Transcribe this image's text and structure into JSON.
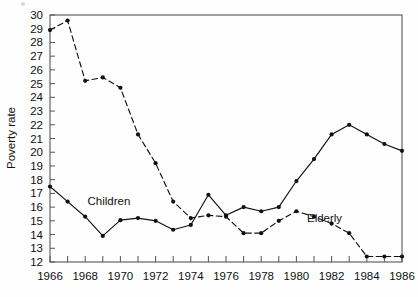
{
  "chart_data": {
    "type": "line",
    "title": "",
    "subtitle": "",
    "xlabel": "",
    "ylabel": "Poverty rate",
    "xlim": [
      1966,
      1986
    ],
    "ylim": [
      12,
      30
    ],
    "ytick_step": 1,
    "xtick_step": 1,
    "xtick_label_step": 2,
    "grid": false,
    "legend_position": "inline-annotation",
    "x": [
      1966,
      1967,
      1968,
      1969,
      1970,
      1971,
      1972,
      1973,
      1974,
      1975,
      1976,
      1977,
      1978,
      1979,
      1980,
      1981,
      1982,
      1983,
      1984,
      1985,
      1986
    ],
    "yticks": [
      12,
      13,
      14,
      15,
      16,
      17,
      18,
      19,
      20,
      21,
      22,
      23,
      24,
      25,
      26,
      27,
      28,
      29,
      30
    ],
    "ytick_labels": [
      "12",
      "13",
      "14",
      "15",
      "16",
      "17",
      "18",
      "19",
      "20",
      "21",
      "22",
      "23",
      "24",
      "25",
      "26",
      "27",
      "28",
      "29",
      "30"
    ],
    "xticks": [
      1966,
      1967,
      1968,
      1969,
      1970,
      1971,
      1972,
      1973,
      1974,
      1975,
      1976,
      1977,
      1978,
      1979,
      1980,
      1981,
      1982,
      1983,
      1984,
      1985,
      1986
    ],
    "xtick_labels": [
      "1966",
      "",
      "1968",
      "",
      "1970",
      "",
      "1972",
      "",
      "1974",
      "",
      "1976",
      "",
      "1978",
      "",
      "1980",
      "",
      "1982",
      "",
      "1984",
      "",
      "1986"
    ],
    "xtick_labels_shown": [
      "1966",
      "1968",
      "1970",
      "1972",
      "1974",
      "1976",
      "1978",
      "1980",
      "1982",
      "1984",
      "1986"
    ],
    "series": [
      {
        "name": "Children",
        "label": "Children",
        "style": "solid",
        "color": "#111111",
        "marker": "filled-circle",
        "values": [
          17.5,
          16.4,
          15.3,
          13.9,
          15.05,
          15.2,
          15.0,
          14.35,
          14.7,
          16.9,
          15.4,
          16.0,
          15.7,
          16.0,
          17.9,
          19.5,
          21.3,
          22.0,
          21.3,
          20.6,
          20.1
        ]
      },
      {
        "name": "Elderly",
        "label": "Elderly",
        "style": "dashed",
        "color": "#111111",
        "marker": "filled-circle",
        "values": [
          28.9,
          29.6,
          25.2,
          25.45,
          24.7,
          21.3,
          19.2,
          16.4,
          15.2,
          15.4,
          15.3,
          14.1,
          14.1,
          15.0,
          15.7,
          15.3,
          14.8,
          14.1,
          12.4,
          12.4,
          12.4
        ]
      }
    ],
    "annotations": [
      {
        "text": "Children",
        "x": 1969.35,
        "y": 16.15
      },
      {
        "text": "Elderly",
        "x": 1981.6,
        "y": 14.95
      }
    ]
  }
}
